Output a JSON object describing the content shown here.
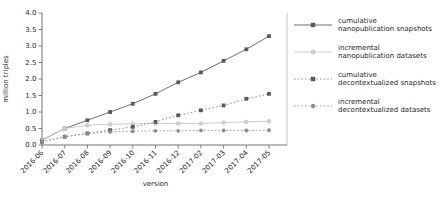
{
  "chart_data": {
    "type": "line",
    "title": "",
    "xlabel": "version",
    "ylabel": "million triples",
    "x_categories": [
      "2016-06",
      "2016-07",
      "2016-08",
      "2016-09",
      "2016-10",
      "2016-11",
      "2016-12",
      "2017-02",
      "2017-03",
      "2017-04",
      "2017-05"
    ],
    "ylim": [
      0.0,
      4.0
    ],
    "ytick_step": 0.5,
    "yticks": [
      "0.0",
      "0.5",
      "1.0",
      "1.5",
      "2.0",
      "2.5",
      "3.0",
      "3.5",
      "4.0"
    ],
    "grid": false,
    "legend_position": "right",
    "colors": {
      "axis": "#737373",
      "right_spine": "#b4b4b4",
      "text": "#262626",
      "dark_gray": "#595959",
      "mid_gray": "#8c8c8c",
      "light_gray": "#cccccc"
    },
    "series": [
      {
        "name": "cumulative nanopublication snapshots",
        "label_lines": [
          "cumulative",
          "nanopublication snapshots"
        ],
        "line_style": "solid",
        "marker": "square",
        "marker_color": "#595959",
        "line_color": "#6e6e6e",
        "values": [
          0.15,
          0.5,
          0.75,
          1.0,
          1.25,
          1.55,
          1.9,
          2.2,
          2.55,
          2.9,
          3.3
        ]
      },
      {
        "name": "incremental nanopublication datasets",
        "label_lines": [
          "incremental",
          "nanopublication datasets"
        ],
        "line_style": "solid",
        "marker": "circle",
        "marker_color": "#d2d2d2",
        "line_color": "#cccccc",
        "values": [
          0.15,
          0.5,
          0.6,
          0.63,
          0.64,
          0.65,
          0.65,
          0.65,
          0.68,
          0.7,
          0.72
        ]
      },
      {
        "name": "cumulative decontextualized snapshots",
        "label_lines": [
          "cumulative",
          "decontextualized snapshots"
        ],
        "line_style": "dotted",
        "marker": "square",
        "marker_color": "#595959",
        "line_color": "#8c8c8c",
        "values": [
          0.1,
          0.25,
          0.35,
          0.45,
          0.55,
          0.7,
          0.9,
          1.05,
          1.2,
          1.4,
          1.55
        ]
      },
      {
        "name": "incremental decontextualized datasets",
        "label_lines": [
          "incremental",
          "decontextualized datasets"
        ],
        "line_style": "dotted",
        "marker": "circle",
        "marker_color": "#8c8c8c",
        "line_color": "#999999",
        "values": [
          0.1,
          0.25,
          0.35,
          0.4,
          0.42,
          0.43,
          0.43,
          0.44,
          0.44,
          0.44,
          0.45
        ]
      }
    ]
  }
}
